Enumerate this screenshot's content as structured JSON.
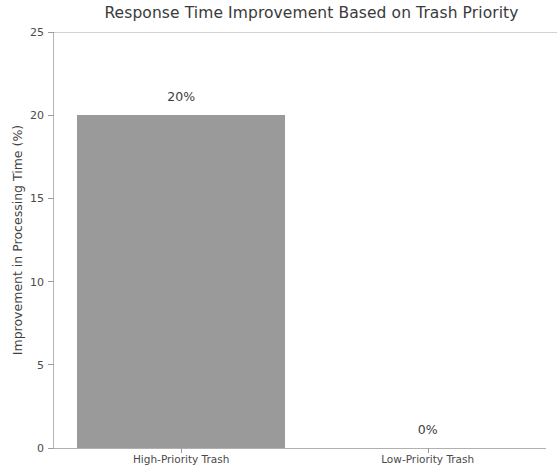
{
  "chart_data": {
    "type": "bar",
    "title": "Response Time Improvement Based on Trash Priority",
    "xlabel": "",
    "ylabel": "Improvement in Processing Time (%)",
    "categories": [
      "High-Priority Trash",
      "Low-Priority Trash"
    ],
    "values": [
      20,
      0
    ],
    "value_labels": [
      "20%",
      "0%"
    ],
    "ylim": [
      0,
      25
    ],
    "yticks": [
      0,
      5,
      10,
      15,
      20,
      25
    ],
    "ytick_labels": [
      "0",
      "5",
      "10",
      "15",
      "20",
      "25"
    ],
    "grid": false,
    "legend": null,
    "bar_color": "#9a9a9a",
    "text_color": "#3d3d3d",
    "axis_color": "#b0b0b0",
    "background": "#ffffff"
  }
}
